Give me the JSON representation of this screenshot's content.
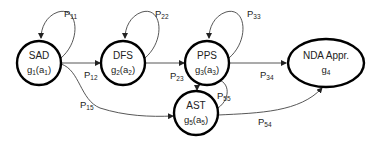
{
  "nodes": {
    "sad": {
      "name": "SAD",
      "fn": "g",
      "fn_sub": "1",
      "arg": "a",
      "arg_sub": "1"
    },
    "dfs": {
      "name": "DFS",
      "fn": "g",
      "fn_sub": "2",
      "arg": "a",
      "arg_sub": "2"
    },
    "pps": {
      "name": "PPS",
      "fn": "g",
      "fn_sub": "3",
      "arg": "a",
      "arg_sub": "3"
    },
    "nda": {
      "name": "NDA Appr.",
      "fn": "g",
      "fn_sub": "4"
    },
    "ast": {
      "name": "AST",
      "fn": "g",
      "fn_sub": "5",
      "arg": "a",
      "arg_sub": "5"
    }
  },
  "edges": {
    "p11": {
      "base": "P",
      "sub": "11"
    },
    "p12": {
      "base": "P",
      "sub": "12"
    },
    "p15": {
      "base": "P",
      "sub": "15"
    },
    "p22": {
      "base": "P",
      "sub": "22"
    },
    "p23": {
      "base": "P",
      "sub": "23"
    },
    "p33": {
      "base": "P",
      "sub": "33"
    },
    "p34": {
      "base": "P",
      "sub": "34"
    },
    "p55": {
      "base": "P",
      "sub": "55"
    },
    "p54": {
      "base": "P",
      "sub": "54"
    }
  }
}
